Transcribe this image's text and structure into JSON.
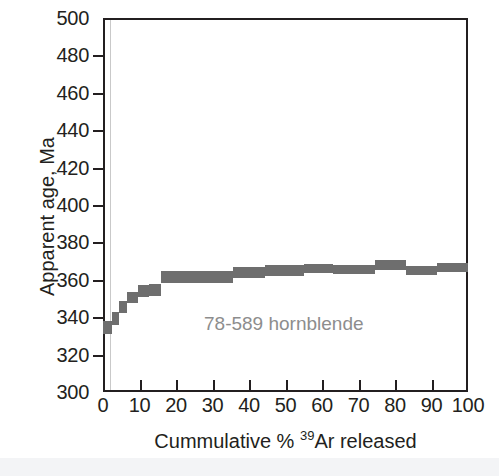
{
  "figure": {
    "background": "#ffffff",
    "frame_color": "#231f20",
    "band_color": "#6e6e6e",
    "annotation_color": "#8d8d8d"
  },
  "annotation": "78-589 hornblende",
  "y_axis_title": "Apparent age, Ma",
  "x_axis_title_pre": "Cummulative % ",
  "x_axis_title_sup": "39",
  "x_axis_title_post": "Ar released",
  "chart_data": {
    "type": "bar",
    "title": "",
    "subtitle": "",
    "xlabel": "Cummulative % 39Ar released",
    "ylabel": "Apparent age, Ma",
    "xlim": [
      0,
      100
    ],
    "ylim": [
      300,
      500
    ],
    "xticks": [
      0,
      10,
      20,
      30,
      40,
      50,
      60,
      70,
      80,
      90,
      100
    ],
    "yticks": [
      300,
      320,
      340,
      360,
      380,
      400,
      420,
      440,
      460,
      480,
      500
    ],
    "grid": false,
    "legend": null,
    "annotations": [
      {
        "text": "78-589 hornblende",
        "x": 42,
        "y": 340,
        "color": "#8d8d8d"
      }
    ],
    "series": [
      {
        "name": "78-589 hornblende release spectrum",
        "style": "step-box-with-uncertainty",
        "color": "#6e6e6e",
        "xunit": "cumulative % 39Ar released",
        "yunit": "Ma",
        "steps": [
          {
            "x_start": 0.0,
            "x_end": 2.5,
            "age": 334.5,
            "age_low": 331.0,
            "age_high": 338.0
          },
          {
            "x_start": 2.5,
            "x_end": 4.5,
            "age": 339.5,
            "age_low": 336.0,
            "age_high": 343.0
          },
          {
            "x_start": 4.5,
            "x_end": 6.5,
            "age": 345.5,
            "age_low": 342.5,
            "age_high": 348.5
          },
          {
            "x_start": 6.5,
            "x_end": 9.5,
            "age": 350.5,
            "age_low": 347.5,
            "age_high": 353.5
          },
          {
            "x_start": 9.5,
            "x_end": 12.5,
            "age": 354.0,
            "age_low": 351.0,
            "age_high": 357.0
          },
          {
            "x_start": 12.5,
            "x_end": 16.0,
            "age": 354.5,
            "age_low": 351.5,
            "age_high": 357.5
          },
          {
            "x_start": 16.0,
            "x_end": 35.5,
            "age": 361.5,
            "age_low": 358.5,
            "age_high": 364.5
          },
          {
            "x_start": 35.5,
            "x_end": 44.5,
            "age": 364.0,
            "age_low": 361.0,
            "age_high": 367.0
          },
          {
            "x_start": 44.5,
            "x_end": 55.0,
            "age": 365.0,
            "age_low": 362.0,
            "age_high": 368.0
          },
          {
            "x_start": 55.0,
            "x_end": 63.0,
            "age": 366.0,
            "age_low": 363.5,
            "age_high": 368.5
          },
          {
            "x_start": 63.0,
            "x_end": 74.5,
            "age": 365.5,
            "age_low": 363.0,
            "age_high": 368.0
          },
          {
            "x_start": 74.5,
            "x_end": 83.0,
            "age": 368.0,
            "age_low": 365.5,
            "age_high": 370.5
          },
          {
            "x_start": 83.0,
            "x_end": 91.5,
            "age": 365.0,
            "age_low": 362.5,
            "age_high": 367.5
          },
          {
            "x_start": 91.5,
            "x_end": 100.0,
            "age": 366.5,
            "age_low": 364.0,
            "age_high": 369.0
          }
        ]
      }
    ]
  }
}
